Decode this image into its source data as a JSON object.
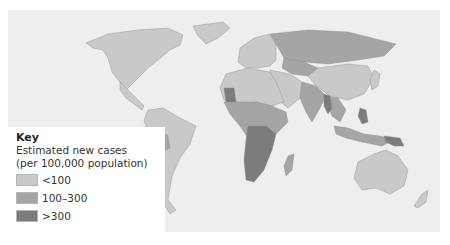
{
  "legend": {
    "title": "Key",
    "subtitle_line1": "Estimated new cases",
    "subtitle_line2": "(per 100,000 population)",
    "items": [
      {
        "label": "<100",
        "color": "#c9c9c9"
      },
      {
        "label": "100–300",
        "color": "#a5a5a5"
      },
      {
        "label": ">300",
        "color": "#7c7c7c"
      }
    ]
  },
  "map": {
    "type": "choropleth world map",
    "background": "#eeeeee",
    "regions": [
      {
        "name": "North America",
        "category": "<100"
      },
      {
        "name": "Greenland",
        "category": "<100"
      },
      {
        "name": "Central America",
        "category": "<100"
      },
      {
        "name": "South America (most)",
        "category": "<100"
      },
      {
        "name": "Bolivia / Peru",
        "category": "100–300"
      },
      {
        "name": "Europe",
        "category": "<100"
      },
      {
        "name": "Russia",
        "category": "100–300"
      },
      {
        "name": "North Africa",
        "category": "<100"
      },
      {
        "name": "Mauritania",
        "category": ">300"
      },
      {
        "name": "Sub-Saharan Africa",
        "category": "100–300"
      },
      {
        "name": "Southern Africa",
        "category": ">300"
      },
      {
        "name": "Middle East",
        "category": "<100"
      },
      {
        "name": "India",
        "category": "100–300"
      },
      {
        "name": "China",
        "category": "<100"
      },
      {
        "name": "Southeast Asia",
        "category": "100–300"
      },
      {
        "name": "Myanmar / Philippines",
        "category": ">300"
      },
      {
        "name": "Australia",
        "category": "<100"
      },
      {
        "name": "New Zealand",
        "category": "<100"
      }
    ]
  }
}
